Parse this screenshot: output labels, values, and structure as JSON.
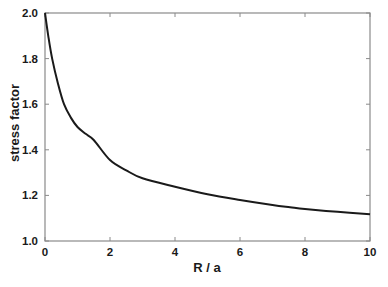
{
  "chart_data": {
    "type": "line",
    "title": "",
    "xlabel": "R / a",
    "ylabel": "stress factor",
    "xlim": [
      0,
      10
    ],
    "ylim": [
      1.0,
      2.0
    ],
    "xticks": [
      0,
      2,
      4,
      6,
      8,
      10
    ],
    "yticks": [
      1.0,
      1.2,
      1.4,
      1.6,
      1.8,
      2.0
    ],
    "xtick_labels": [
      "0",
      "2",
      "4",
      "6",
      "8",
      "10"
    ],
    "ytick_labels": [
      "1.0",
      "1.2",
      "1.4",
      "1.6",
      "1.8",
      "2.0"
    ],
    "grid": false,
    "legend": null,
    "series": [
      {
        "name": "stress factor",
        "color": "#1a1a1a",
        "x": [
          0,
          0.1,
          0.22,
          0.4,
          0.585,
          0.8,
          1.0,
          1.25,
          1.5,
          2.0,
          2.5,
          3.0,
          4.0,
          5.0,
          6.0,
          7.0,
          7.54,
          8.0,
          9.0,
          10.0
        ],
        "y": [
          2.0,
          1.9,
          1.8,
          1.69,
          1.6,
          1.54,
          1.5,
          1.47,
          1.443,
          1.355,
          1.31,
          1.275,
          1.238,
          1.205,
          1.18,
          1.158,
          1.148,
          1.14,
          1.128,
          1.117
        ]
      }
    ]
  }
}
